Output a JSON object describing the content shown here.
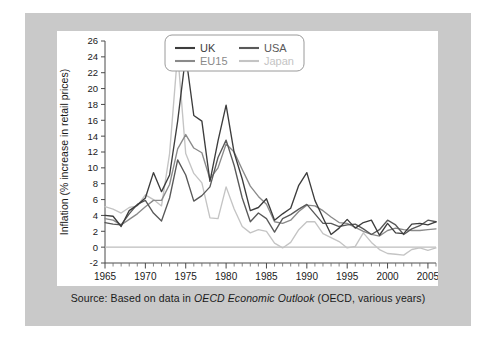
{
  "figure": {
    "background_color": "#c9c9c9",
    "panel_color": "#ffffff",
    "caption_prefix": "Source: Based on data in ",
    "caption_italic": "OECD Economic Outlook",
    "caption_suffix": " (OECD, various years)"
  },
  "chart_data": {
    "type": "line",
    "title": "",
    "xlabel": "",
    "ylabel": "Inflation (% increase in retail prices)",
    "xlim": [
      1965,
      2006
    ],
    "ylim": [
      -2,
      26
    ],
    "ytick_step": 2,
    "yticks": [
      -2,
      0,
      2,
      4,
      6,
      8,
      10,
      12,
      14,
      16,
      18,
      20,
      22,
      24,
      26
    ],
    "xticks": [
      1965,
      1970,
      1975,
      1980,
      1985,
      1990,
      1995,
      2000,
      2005
    ],
    "xtick_labels": [
      "1965",
      "1970",
      "1975",
      "1980",
      "1985",
      "1990",
      "1995",
      "2000",
      "2005"
    ],
    "ytick_labels": [
      "-2",
      "0",
      "2",
      "4",
      "6",
      "8",
      "10",
      "12",
      "14",
      "16",
      "18",
      "20",
      "22",
      "24",
      "26"
    ],
    "minor_xtick_step": 1,
    "grid": false,
    "zero_line": true,
    "legend_position": "top-center",
    "x": [
      1965,
      1966,
      1967,
      1968,
      1969,
      1970,
      1971,
      1972,
      1973,
      1974,
      1975,
      1976,
      1977,
      1978,
      1979,
      1980,
      1981,
      1982,
      1983,
      1984,
      1985,
      1986,
      1987,
      1988,
      1989,
      1990,
      1991,
      1992,
      1993,
      1994,
      1995,
      1996,
      1997,
      1998,
      1999,
      2000,
      2001,
      2002,
      2003,
      2004,
      2005,
      2006
    ],
    "series": [
      {
        "name": "UK",
        "color": "#3d3d3d",
        "values": [
          4.0,
          3.9,
          2.6,
          4.6,
          5.3,
          6.2,
          9.4,
          7.0,
          9.1,
          15.9,
          24.2,
          16.6,
          15.9,
          8.3,
          13.4,
          17.9,
          11.9,
          8.6,
          4.6,
          5.0,
          6.1,
          3.4,
          4.2,
          4.9,
          7.8,
          9.4,
          5.9,
          3.7,
          1.6,
          2.4,
          3.5,
          2.4,
          3.1,
          3.4,
          1.5,
          3.0,
          1.8,
          1.7,
          2.9,
          3.0,
          2.8,
          3.2
        ]
      },
      {
        "name": "USA",
        "color": "#595959",
        "values": [
          3.1,
          2.9,
          2.8,
          4.2,
          5.4,
          5.9,
          4.3,
          3.3,
          6.2,
          11.0,
          9.1,
          5.8,
          6.5,
          7.6,
          11.3,
          13.5,
          10.3,
          6.2,
          3.2,
          4.3,
          3.6,
          1.9,
          3.6,
          4.1,
          4.8,
          5.4,
          4.2,
          3.0,
          3.0,
          2.6,
          2.8,
          2.9,
          2.3,
          1.6,
          2.2,
          3.4,
          2.8,
          1.6,
          2.3,
          2.7,
          3.4,
          3.2
        ]
      },
      {
        "name": "EU15",
        "color": "#8a8a8a",
        "values": [
          3.6,
          3.4,
          2.8,
          3.5,
          4.2,
          5.1,
          5.9,
          5.9,
          7.9,
          12.4,
          14.2,
          12.5,
          11.9,
          8.6,
          10.0,
          13.0,
          12.0,
          9.8,
          7.7,
          6.4,
          5.4,
          3.2,
          3.0,
          3.4,
          4.5,
          5.3,
          5.2,
          4.6,
          3.8,
          3.1,
          3.0,
          2.5,
          2.0,
          1.6,
          1.4,
          2.1,
          2.4,
          2.2,
          2.1,
          2.1,
          2.2,
          2.3
        ]
      },
      {
        "name": "Japan",
        "color": "#c4c4c4",
        "values": [
          5.1,
          4.8,
          4.3,
          5.0,
          5.2,
          6.6,
          6.0,
          5.2,
          11.8,
          24.5,
          11.8,
          9.3,
          8.1,
          3.7,
          3.6,
          7.6,
          4.8,
          2.6,
          1.8,
          2.2,
          2.0,
          0.5,
          -0.1,
          0.6,
          2.2,
          3.2,
          3.2,
          1.7,
          1.2,
          0.7,
          -0.1,
          0.1,
          1.8,
          0.6,
          -0.3,
          -0.8,
          -0.9,
          -1.0,
          -0.3,
          -0.1,
          -0.4,
          -0.1
        ]
      }
    ]
  },
  "legend": {
    "entries": [
      {
        "label": "UK",
        "color": "#3d3d3d"
      },
      {
        "label": "USA",
        "color": "#595959"
      },
      {
        "label": "EU15",
        "color": "#8a8a8a"
      },
      {
        "label": "Japan",
        "color": "#c4c4c4"
      }
    ]
  }
}
